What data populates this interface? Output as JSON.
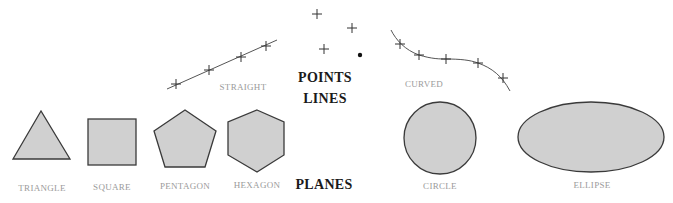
{
  "headings": {
    "points": "POINTS",
    "lines": "LINES",
    "planes": "PLANES"
  },
  "line_labels": {
    "straight": "STRAIGHT",
    "curved": "CURVED"
  },
  "shape_labels": {
    "triangle": "TRIANGLE",
    "square": "SQUARE",
    "pentagon": "PENTAGON",
    "hexagon": "HEXAGON",
    "circle": "CIRCLE",
    "ellipse": "ELLIPSE"
  },
  "colors": {
    "fill": "#d0d0d0",
    "stroke": "#3a3a3a",
    "label": "#9a9a9a",
    "heading": "#1a1a1a"
  }
}
